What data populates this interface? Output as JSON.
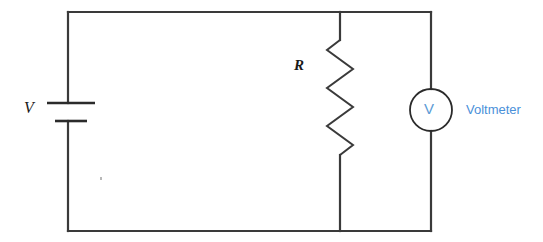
{
  "figure": {
    "background_color": "#ffffff",
    "width": 543,
    "height": 242
  },
  "colors": {
    "wire": "#3a3a3a",
    "component_outline": "#2b2b2b",
    "label_dark": "#1a1a1a",
    "voltmeter_symbol_blue": "#5b9bd5",
    "voltmeter_label_blue": "#4a90d9"
  },
  "labels": {
    "source": "V",
    "resistor": "R",
    "voltmeter_symbol": "V",
    "voltmeter_name": "Voltmeter"
  },
  "components": {
    "battery": {
      "name": "battery-source",
      "symbol": "two-plate-cell",
      "label": "V",
      "position": {
        "x": 68,
        "y": 110
      },
      "long_plate": {
        "x1": 47,
        "x2": 95,
        "y": 103
      },
      "short_plate": {
        "x1": 55,
        "x2": 87,
        "y": 121
      }
    },
    "resistor": {
      "name": "resistor",
      "symbol": "zigzag",
      "label": "R",
      "branch_x": 340,
      "top_y": 12,
      "bottom_y": 231,
      "zigzag_top_y": 40,
      "zigzag_bottom_y": 155,
      "peaks": 6,
      "amplitude_px": 13
    },
    "voltmeter": {
      "name": "voltmeter",
      "symbol": "circle-with-V",
      "label": "Voltmeter",
      "center": {
        "x": 431,
        "y": 110
      },
      "radius": 21
    }
  },
  "wires": {
    "outline": {
      "left_x": 68,
      "right_x": 431,
      "top_y": 12,
      "bottom_y": 231
    },
    "segments": [
      {
        "name": "top-wire",
        "from": [
          68,
          12
        ],
        "to": [
          431,
          12
        ]
      },
      {
        "name": "bottom-wire",
        "from": [
          68,
          231
        ],
        "to": [
          431,
          231
        ]
      },
      {
        "name": "left-wire-upper",
        "from": [
          68,
          12
        ],
        "to": [
          68,
          103
        ]
      },
      {
        "name": "left-wire-lower",
        "from": [
          68,
          121
        ],
        "to": [
          68,
          231
        ]
      },
      {
        "name": "right-wire-upper",
        "from": [
          431,
          12
        ],
        "to": [
          431,
          89
        ]
      },
      {
        "name": "right-wire-lower",
        "from": [
          431,
          131
        ],
        "to": [
          431,
          231
        ]
      },
      {
        "name": "resistor-branch-upper",
        "from": [
          340,
          12
        ],
        "to": [
          340,
          40
        ]
      },
      {
        "name": "resistor-branch-lower",
        "from": [
          340,
          155
        ],
        "to": [
          340,
          231
        ]
      }
    ]
  }
}
